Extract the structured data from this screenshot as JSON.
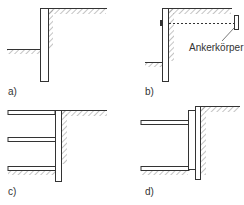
{
  "colors": {
    "line": "#333333",
    "hatch": "#8a8a8a",
    "background": "#ffffff"
  },
  "panels": [
    {
      "id": "a",
      "label": "a)",
      "description": "cantilever retaining wall"
    },
    {
      "id": "b",
      "label": "b)",
      "description": "anchored retaining wall",
      "anchor_label": "Ankerkörper"
    },
    {
      "id": "c",
      "label": "c)",
      "description": "strutted retaining wall, three struts"
    },
    {
      "id": "d",
      "label": "d)",
      "description": "strutted retaining wall with waler, two struts"
    }
  ]
}
